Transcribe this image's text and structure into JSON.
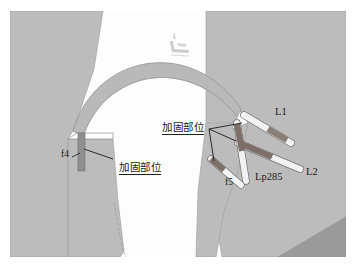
{
  "figure": {
    "kind": "engineering-cross-section-diagram",
    "caption": "",
    "background_color": "#ffffff",
    "canvas": {
      "width": 355,
      "height": 266
    }
  },
  "palette": {
    "ground_fill": "#bcbcbc",
    "ground_fill_dark": "#9a9a9a",
    "arch_band": "#b9b9b9",
    "void_white": "#fdfdfd",
    "rod_body": "#f2f2f2",
    "rod_reinforced": "#8a7f77",
    "rod_reinforced_alt": "#7e7068",
    "outline": "#6f6f6f",
    "leader_line": "#1b1b1b",
    "text": "#1a1a1a"
  },
  "labels": {
    "l1": "L1",
    "l2": "L2",
    "lp285": "Lp285",
    "f4": "f4",
    "f5": "f5",
    "reinforce_upper": "加固部位",
    "reinforce_lower": "加固部位"
  },
  "annotations": [
    {
      "id": "reinforce-upper",
      "text": "加固部位",
      "underlined": true,
      "leader_count": 3
    },
    {
      "id": "reinforce-lower",
      "text": "加固部位",
      "underlined": true,
      "leader_count": 1
    }
  ],
  "elements": [
    {
      "name": "rod-L1",
      "label": "L1",
      "has_reinforced_segment": true
    },
    {
      "name": "rod-L2",
      "label": "L2",
      "has_reinforced_segment": true
    },
    {
      "name": "rod-Lp285",
      "label": "Lp285",
      "has_reinforced_segment": true
    },
    {
      "name": "bar-f4",
      "label": "f4",
      "has_reinforced_segment": false
    },
    {
      "name": "rod-f5",
      "label": "f5",
      "has_reinforced_segment": true
    }
  ],
  "watermark": {
    "present": true,
    "legible": false,
    "text": ""
  }
}
